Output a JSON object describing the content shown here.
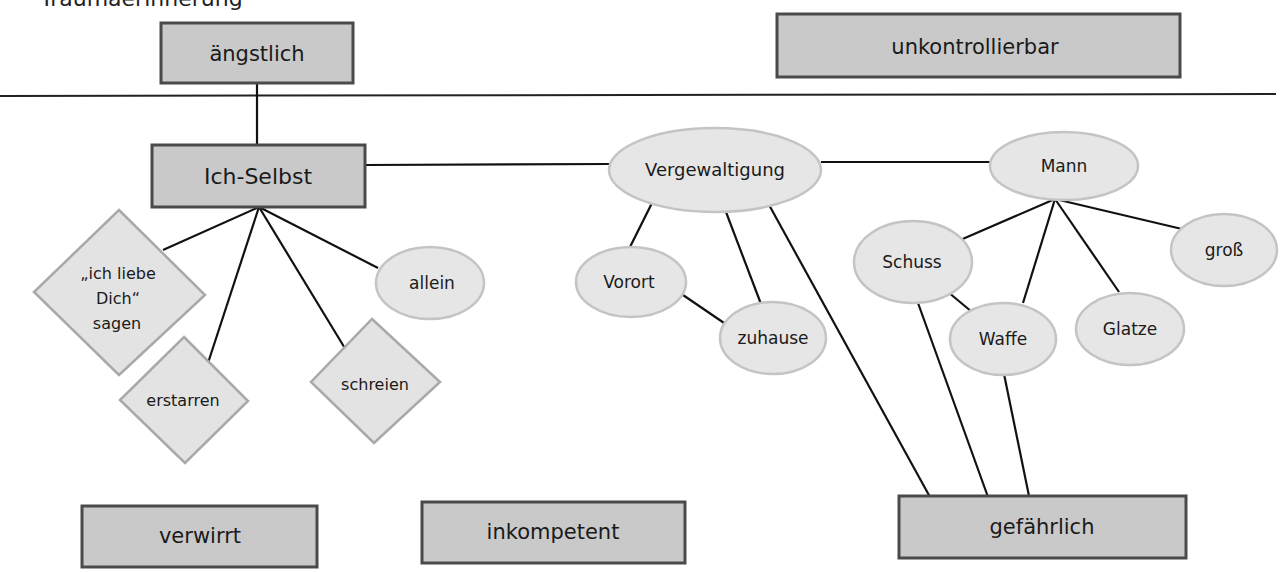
{
  "header": {
    "title": "Traumaerinnerung"
  },
  "colors": {
    "rect_fill": "#c9c9c9",
    "rect_stroke": "#4a4a4a",
    "ellipse_fill": "#e6e6e6",
    "ellipse_stroke": "#c4c4c4",
    "diamond_fill": "#e3e3e3",
    "diamond_stroke": "#a9a9a9",
    "edge": "#111111"
  },
  "nodes": {
    "aengstlich": {
      "label": "ängstlich",
      "shape": "rect"
    },
    "unkontrollierbar": {
      "label": "unkontrollierbar",
      "shape": "rect"
    },
    "ich_selbst": {
      "label": "Ich-Selbst",
      "shape": "rect"
    },
    "vergewaltigung": {
      "label": "Vergewaltigung",
      "shape": "ellipse"
    },
    "mann": {
      "label": "Mann",
      "shape": "ellipse"
    },
    "ich_liebe_dich": {
      "label_lines": [
        "„ich liebe",
        "Dich“",
        "sagen"
      ],
      "shape": "diamond"
    },
    "erstarren": {
      "label": "erstarren",
      "shape": "diamond"
    },
    "schreien": {
      "label": "schreien",
      "shape": "diamond"
    },
    "allein": {
      "label": "allein",
      "shape": "ellipse"
    },
    "vorort": {
      "label": "Vorort",
      "shape": "ellipse"
    },
    "zuhause": {
      "label": "zuhause",
      "shape": "ellipse"
    },
    "schuss": {
      "label": "Schuss",
      "shape": "ellipse"
    },
    "waffe": {
      "label": "Waffe",
      "shape": "ellipse"
    },
    "glatze": {
      "label": "Glatze",
      "shape": "ellipse"
    },
    "gross": {
      "label": "groß",
      "shape": "ellipse"
    },
    "verwirrt": {
      "label": "verwirrt",
      "shape": "rect"
    },
    "inkompetent": {
      "label": "inkompetent",
      "shape": "rect"
    },
    "gefaehrlich": {
      "label": "gefährlich",
      "shape": "rect"
    }
  },
  "edges": [
    [
      "aengstlich",
      "ich_selbst"
    ],
    [
      "ich_selbst",
      "vergewaltigung"
    ],
    [
      "vergewaltigung",
      "mann"
    ],
    [
      "ich_selbst",
      "ich_liebe_dich"
    ],
    [
      "ich_selbst",
      "erstarren"
    ],
    [
      "ich_selbst",
      "schreien"
    ],
    [
      "ich_selbst",
      "allein"
    ],
    [
      "vergewaltigung",
      "vorort"
    ],
    [
      "vergewaltigung",
      "zuhause"
    ],
    [
      "vergewaltigung",
      "gefaehrlich"
    ],
    [
      "vorort",
      "zuhause"
    ],
    [
      "mann",
      "schuss"
    ],
    [
      "mann",
      "waffe"
    ],
    [
      "mann",
      "glatze"
    ],
    [
      "mann",
      "gross"
    ],
    [
      "schuss",
      "waffe"
    ],
    [
      "schuss",
      "gefaehrlich"
    ],
    [
      "waffe",
      "gefaehrlich"
    ]
  ]
}
